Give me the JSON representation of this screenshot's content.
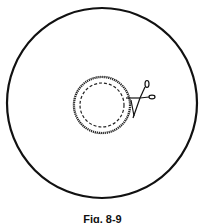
{
  "figure": {
    "caption": "Fig. 8-9",
    "outer_circle": {
      "cx": 102,
      "cy": 103,
      "r": 95,
      "stroke": "#111111"
    },
    "inner_ring": {
      "cx": 102,
      "cy": 105,
      "r": 28,
      "style": "rough"
    },
    "dashed_circle": {
      "cx": 102,
      "cy": 105,
      "r": 22,
      "style": "dashed"
    },
    "scissors": {
      "icon": "scissors-icon",
      "x": 140,
      "y": 95
    }
  }
}
